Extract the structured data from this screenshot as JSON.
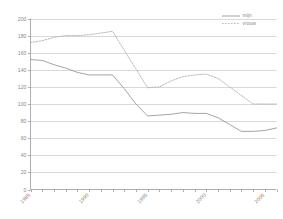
{
  "chart_data": {
    "type": "line",
    "title": "",
    "subtitle": "",
    "xlabel": "",
    "ylabel": "",
    "xlim": [
      1985,
      2006
    ],
    "ylim": [
      0,
      200
    ],
    "grid": true,
    "legend_position": "top-right",
    "y_ticks": [
      0,
      20,
      40,
      60,
      80,
      100,
      120,
      140,
      160,
      180,
      200
    ],
    "x_ticks": [
      1985,
      1986,
      1987,
      1988,
      1989,
      1990,
      1991,
      1992,
      1993,
      1994,
      1995,
      1996,
      1997,
      1998,
      1999,
      2000,
      2001,
      2002,
      2003,
      2004,
      2005,
      2006
    ],
    "x_tick_labels": [
      {
        "x": 1985,
        "label": "1985"
      },
      {
        "x": 1990,
        "label": "1990"
      },
      {
        "x": 1995,
        "label": "1995"
      },
      {
        "x": 2000,
        "label": "2000"
      },
      {
        "x": 2005,
        "label": "2005"
      }
    ],
    "x": [
      1985,
      1986,
      1987,
      1988,
      1989,
      1990,
      1991,
      1992,
      1993,
      1994,
      1995,
      1996,
      1997,
      1998,
      1999,
      2000,
      2001,
      2002,
      2003,
      2004,
      2005,
      2006
    ],
    "series": [
      {
        "name": "mijn",
        "style": "solid",
        "color": "#9a9a9a",
        "values": [
          152,
          151,
          146,
          142,
          137,
          134,
          134,
          134,
          118,
          100,
          86,
          87,
          88,
          90,
          89,
          89,
          84,
          76,
          68,
          68,
          69,
          72
        ]
      },
      {
        "name": "vrouw",
        "style": "dotted",
        "color": "#b0b0b0",
        "values": [
          172,
          174,
          178,
          180,
          180,
          181,
          183,
          185,
          163,
          141,
          119,
          120,
          127,
          132,
          134,
          135,
          130,
          120,
          110,
          100,
          100,
          100
        ]
      }
    ]
  },
  "legend": {
    "items": [
      {
        "label": "mijn",
        "style": "solid"
      },
      {
        "label": "vrouw",
        "style": "dotted"
      }
    ]
  },
  "colors": {
    "axis": "#9a9a9a",
    "grid": "#c9c9c9",
    "text": "#8a8a8a",
    "series_solid": "#9a9a9a",
    "series_dotted": "#b0b0b0",
    "background": "#ffffff"
  }
}
